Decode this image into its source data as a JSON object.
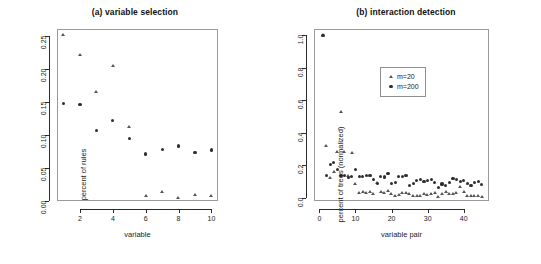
{
  "figure": {
    "width": 541,
    "height": 264,
    "background": "#ffffff",
    "marker_circle_color": "#2e2e2e",
    "marker_triangle_color": "#555555",
    "axis_color": "#2b2b2b",
    "frame_color": "#9a9a9a"
  },
  "chart_data": [
    {
      "type": "scatter",
      "panel": "a",
      "title": "(a) variable selection",
      "xlabel": "variable",
      "ylabel": "percent of rules",
      "xlim": [
        0.6,
        10.4
      ],
      "ylim": [
        0.0,
        0.26
      ],
      "xticks": [
        2,
        4,
        6,
        8,
        10
      ],
      "xticklabels": [
        "2",
        "4",
        "6",
        "8",
        "10"
      ],
      "yticks": [
        0.0,
        0.05,
        0.1,
        0.15,
        0.2,
        0.25
      ],
      "yticklabels": [
        "0.00",
        "0.05",
        "0.10",
        "0.15",
        "0.20",
        "0.25"
      ],
      "grid": false,
      "legend": null,
      "x": [
        1,
        2,
        3,
        4,
        5,
        6,
        7,
        8,
        9,
        10
      ],
      "series": [
        {
          "name": "m=20",
          "marker": "triangle",
          "values": [
            0.251,
            0.221,
            0.165,
            0.204,
            0.112,
            0.007,
            0.014,
            0.005,
            0.009,
            0.008
          ]
        },
        {
          "name": "m=200",
          "marker": "circle",
          "values": [
            0.147,
            0.146,
            0.107,
            0.122,
            0.094,
            0.071,
            0.078,
            0.083,
            0.073,
            0.077
          ]
        }
      ]
    },
    {
      "type": "scatter",
      "panel": "b",
      "title": "(b) interaction detection",
      "xlabel": "variable pair",
      "ylabel": "percent of trees (normalized)",
      "xlim": [
        -1.5,
        47
      ],
      "ylim": [
        -0.02,
        1.04
      ],
      "xticks": [
        0,
        10,
        20,
        30,
        40
      ],
      "xticklabels": [
        "0",
        "10",
        "20",
        "30",
        "40"
      ],
      "yticks": [
        0.0,
        0.2,
        0.4,
        0.6,
        0.8,
        1.0
      ],
      "yticklabels": [
        "0.0",
        "0.2",
        "0.4",
        "0.6",
        "0.8",
        "1.0"
      ],
      "grid": false,
      "legend": {
        "position": "upper-center",
        "entries": [
          {
            "label": "m=20",
            "marker": "triangle"
          },
          {
            "label": "m=200",
            "marker": "circle"
          }
        ]
      },
      "x": [
        1,
        2,
        3,
        4,
        5,
        6,
        7,
        8,
        9,
        10,
        11,
        12,
        13,
        14,
        15,
        16,
        17,
        18,
        19,
        20,
        21,
        22,
        23,
        24,
        25,
        26,
        27,
        28,
        29,
        30,
        31,
        32,
        33,
        34,
        35,
        36,
        37,
        38,
        39,
        40,
        41,
        42,
        43,
        44,
        45
      ],
      "series": [
        {
          "name": "m=20",
          "marker": "triangle",
          "values": [
            1.0,
            0.315,
            0.118,
            0.155,
            0.283,
            0.525,
            0.283,
            0.135,
            0.277,
            0.085,
            0.03,
            0.035,
            0.028,
            0.032,
            0.02,
            0.09,
            0.035,
            0.03,
            0.04,
            0.02,
            0.012,
            0.015,
            0.03,
            0.028,
            0.02,
            0.012,
            0.008,
            0.012,
            0.02,
            0.018,
            0.022,
            0.03,
            0.006,
            0.022,
            0.035,
            0.025,
            0.02,
            0.03,
            0.065,
            0.035,
            0.012,
            0.008,
            0.01,
            0.008,
            0.006
          ]
        },
        {
          "name": "m=200",
          "marker": "circle",
          "values": [
            1.0,
            0.135,
            0.205,
            0.215,
            0.175,
            0.135,
            0.135,
            0.125,
            0.13,
            0.175,
            0.13,
            0.13,
            0.135,
            0.135,
            0.115,
            0.09,
            0.13,
            0.128,
            0.148,
            0.09,
            0.095,
            0.13,
            0.13,
            0.135,
            0.075,
            0.09,
            0.105,
            0.115,
            0.1,
            0.105,
            0.112,
            0.095,
            0.065,
            0.085,
            0.075,
            0.095,
            0.12,
            0.115,
            0.1,
            0.105,
            0.09,
            0.075,
            0.095,
            0.1,
            0.08
          ]
        }
      ]
    }
  ]
}
